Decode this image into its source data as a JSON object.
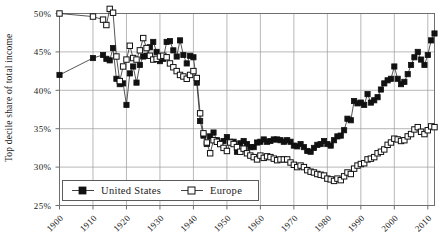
{
  "chart_data": {
    "type": "line",
    "title": "",
    "subtitle": "",
    "xlabel": "",
    "ylabel": "Top decile share of total income",
    "xlim": [
      1900,
      2012
    ],
    "ylim": [
      25,
      50
    ],
    "ytick_labels": [
      "25%",
      "30%",
      "35%",
      "40%",
      "45%",
      "50%"
    ],
    "ytick_values": [
      25,
      30,
      35,
      40,
      45,
      50
    ],
    "xtick_labels": [
      "1900",
      "1910",
      "1920",
      "1930",
      "1940",
      "1950",
      "1960",
      "1970",
      "1980",
      "1990",
      "2000",
      "2010"
    ],
    "xtick_values": [
      1900,
      1910,
      1920,
      1930,
      1940,
      1950,
      1960,
      1970,
      1980,
      1990,
      2000,
      2010
    ],
    "grid": true,
    "legend_position": "bottom-left",
    "legend": [
      "United States",
      "Europe"
    ],
    "series": [
      {
        "name": "United States",
        "marker": "filled-square",
        "color": "#111111",
        "x": [
          1900,
          1910,
          1913,
          1914,
          1915,
          1916,
          1917,
          1918,
          1919,
          1920,
          1921,
          1922,
          1923,
          1924,
          1925,
          1926,
          1927,
          1928,
          1929,
          1930,
          1931,
          1932,
          1933,
          1934,
          1935,
          1936,
          1937,
          1938,
          1939,
          1940,
          1941,
          1942,
          1943,
          1944,
          1945,
          1946,
          1947,
          1948,
          1949,
          1950,
          1951,
          1952,
          1953,
          1954,
          1955,
          1956,
          1957,
          1958,
          1959,
          1960,
          1961,
          1962,
          1963,
          1964,
          1965,
          1966,
          1967,
          1968,
          1969,
          1970,
          1971,
          1972,
          1973,
          1974,
          1975,
          1976,
          1977,
          1978,
          1979,
          1980,
          1981,
          1982,
          1983,
          1984,
          1985,
          1986,
          1987,
          1988,
          1989,
          1990,
          1991,
          1992,
          1993,
          1994,
          1995,
          1996,
          1997,
          1998,
          1999,
          2000,
          2001,
          2002,
          2003,
          2004,
          2005,
          2006,
          2007,
          2008,
          2009,
          2010,
          2011,
          2012
        ],
        "y": [
          42.0,
          44.2,
          44.6,
          44.1,
          43.9,
          45.5,
          41.5,
          40.8,
          40.9,
          38.1,
          42.2,
          43.1,
          41.0,
          43.3,
          44.4,
          44.5,
          45.6,
          46.3,
          45.0,
          43.8,
          44.1,
          46.3,
          46.4,
          45.2,
          44.4,
          46.5,
          44.6,
          43.5,
          44.5,
          44.3,
          41.0,
          36.0,
          34.1,
          33.0,
          34.0,
          34.5,
          33.5,
          33.1,
          33.4,
          33.9,
          33.3,
          33.3,
          32.0,
          33.1,
          33.4,
          33.0,
          32.6,
          32.6,
          33.2,
          33.3,
          33.6,
          33.3,
          33.4,
          33.6,
          33.6,
          33.5,
          33.3,
          33.5,
          33.3,
          32.8,
          32.7,
          33.0,
          32.6,
          32.1,
          32.0,
          32.5,
          32.9,
          33.0,
          33.4,
          33.0,
          32.8,
          33.5,
          34.0,
          34.1,
          34.8,
          36.3,
          36.1,
          38.6,
          38.3,
          38.4,
          38.1,
          39.5,
          38.4,
          38.7,
          39.1,
          40.1,
          40.9,
          41.3,
          41.5,
          43.1,
          41.5,
          40.8,
          41.1,
          42.1,
          43.3,
          44.3,
          45.0,
          44.0,
          43.3,
          44.6,
          46.5,
          47.4
        ]
      },
      {
        "name": "Europe",
        "marker": "open-square",
        "color": "#ffffff",
        "x": [
          1900,
          1910,
          1913,
          1914,
          1915,
          1916,
          1917,
          1918,
          1919,
          1920,
          1921,
          1922,
          1923,
          1924,
          1925,
          1926,
          1927,
          1928,
          1929,
          1930,
          1931,
          1932,
          1933,
          1934,
          1935,
          1936,
          1937,
          1938,
          1939,
          1940,
          1941,
          1942,
          1943,
          1944,
          1945,
          1946,
          1947,
          1948,
          1949,
          1950,
          1951,
          1952,
          1953,
          1954,
          1955,
          1956,
          1957,
          1958,
          1959,
          1960,
          1961,
          1962,
          1963,
          1964,
          1965,
          1966,
          1967,
          1968,
          1969,
          1970,
          1971,
          1972,
          1973,
          1974,
          1975,
          1976,
          1977,
          1978,
          1979,
          1980,
          1981,
          1982,
          1983,
          1984,
          1985,
          1986,
          1987,
          1988,
          1989,
          1990,
          1991,
          1992,
          1993,
          1994,
          1995,
          1996,
          1997,
          1998,
          1999,
          2000,
          2001,
          2002,
          2003,
          2004,
          2005,
          2006,
          2007,
          2008,
          2009,
          2010,
          2011,
          2012
        ],
        "y": [
          50.0,
          49.6,
          49.2,
          48.5,
          50.6,
          50.1,
          44.4,
          41.2,
          43.1,
          44.0,
          45.8,
          44.2,
          44.0,
          45.2,
          46.8,
          45.5,
          44.5,
          44.0,
          44.1,
          44.4,
          44.5,
          44.3,
          43.5,
          43.0,
          42.5,
          42.0,
          41.8,
          41.5,
          42.0,
          42.5,
          41.6,
          37.0,
          34.4,
          33.2,
          31.8,
          33.5,
          33.3,
          33.0,
          32.5,
          32.1,
          33.2,
          33.0,
          32.6,
          32.0,
          32.4,
          31.8,
          31.5,
          31.3,
          31.0,
          31.5,
          31.2,
          31.4,
          31.3,
          31.1,
          30.9,
          31.0,
          31.0,
          31.0,
          30.6,
          30.3,
          30.0,
          30.2,
          30.0,
          29.6,
          29.4,
          29.3,
          29.1,
          29.0,
          28.9,
          28.5,
          28.4,
          28.2,
          28.5,
          28.3,
          28.8,
          29.3,
          29.1,
          29.8,
          30.2,
          30.4,
          30.5,
          31.0,
          31.1,
          31.3,
          31.8,
          32.0,
          32.3,
          32.9,
          33.2,
          33.7,
          33.6,
          33.4,
          33.5,
          34.0,
          34.3,
          34.9,
          35.2,
          34.6,
          34.3,
          34.8,
          35.3,
          35.2
        ]
      }
    ]
  },
  "axis": {
    "y_title": "Top decile share of total income"
  },
  "legend": {
    "items": [
      {
        "label": "United States",
        "marker": "filled-square"
      },
      {
        "label": "Europe",
        "marker": "open-square"
      }
    ]
  },
  "colors": {
    "us": "#111111",
    "europe": "#ffffff",
    "axis": "#6f6f6f",
    "grid": "#9a9a9a",
    "text": "#1a1a1a",
    "background": "#ffffff"
  }
}
